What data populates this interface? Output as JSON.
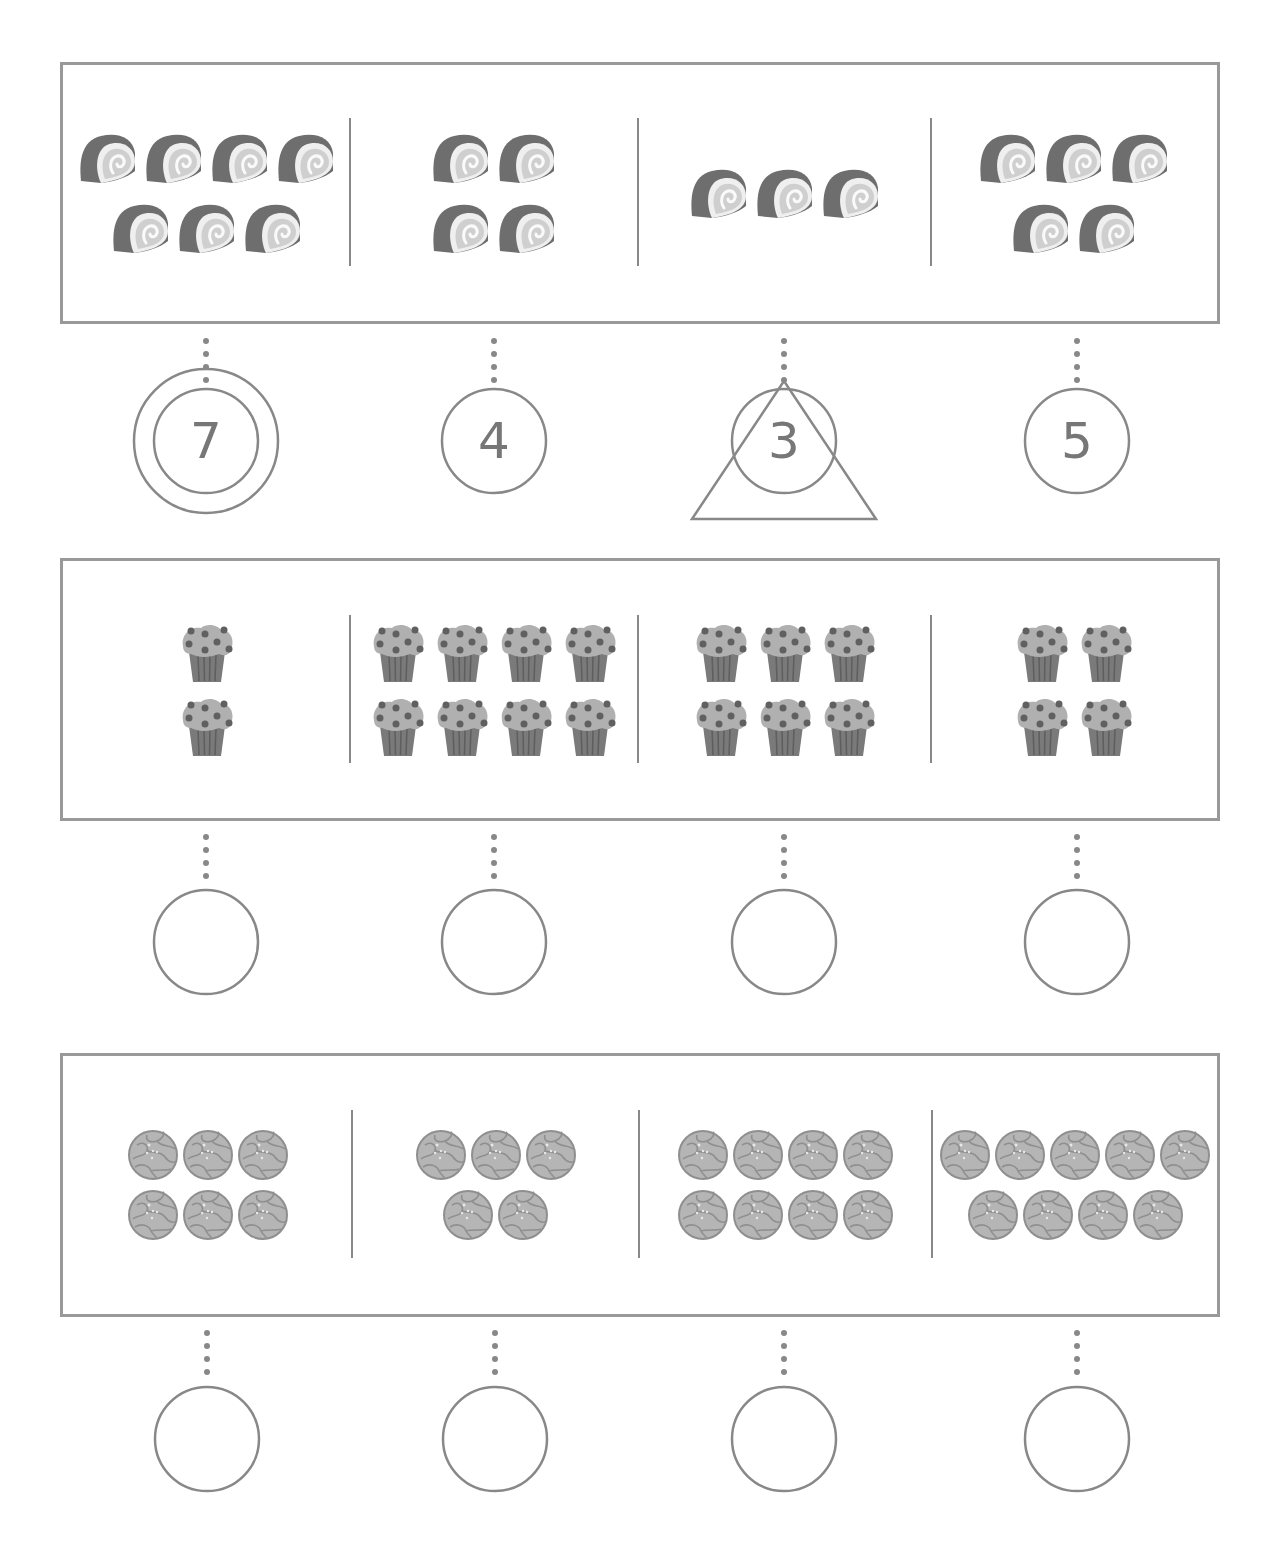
{
  "worksheet": {
    "title_partial": "",
    "colors": {
      "border": "#999999",
      "ink": "#777777",
      "dot": "#888888",
      "roll_dark": "#6e6e6e",
      "roll_light": "#cfcfcf",
      "muffin_top": "#b0b0b0",
      "muffin_cup": "#7a7a7a",
      "berry": "#606060",
      "cookie": "#b5b5b5",
      "cookie_line": "#8f8f8f"
    },
    "rows": [
      {
        "item": "swiss-roll",
        "groups": [
          {
            "count": 7,
            "layout": [
              4,
              3
            ],
            "answer": "7",
            "mark": "double-circle"
          },
          {
            "count": 4,
            "layout": [
              2,
              2
            ],
            "answer": "4",
            "mark": "circle"
          },
          {
            "count": 3,
            "layout": [
              3
            ],
            "answer": "3",
            "mark": "triangle"
          },
          {
            "count": 5,
            "layout": [
              3,
              2
            ],
            "answer": "5",
            "mark": "circle"
          }
        ]
      },
      {
        "item": "muffin",
        "groups": [
          {
            "count": 2,
            "layout": [
              1,
              1
            ],
            "answer": "",
            "mark": "circle"
          },
          {
            "count": 8,
            "layout": [
              4,
              4
            ],
            "answer": "",
            "mark": "circle"
          },
          {
            "count": 6,
            "layout": [
              3,
              3
            ],
            "answer": "",
            "mark": "circle"
          },
          {
            "count": 4,
            "layout": [
              2,
              2
            ],
            "answer": "",
            "mark": "circle"
          }
        ]
      },
      {
        "item": "cookie",
        "groups": [
          {
            "count": 6,
            "layout": [
              3,
              3
            ],
            "answer": "",
            "mark": "circle"
          },
          {
            "count": 5,
            "layout": [
              3,
              2
            ],
            "answer": "",
            "mark": "circle"
          },
          {
            "count": 8,
            "layout": [
              4,
              4
            ],
            "answer": "",
            "mark": "circle"
          },
          {
            "count": 9,
            "layout": [
              5,
              4
            ],
            "answer": "",
            "mark": "circle"
          }
        ]
      }
    ]
  }
}
